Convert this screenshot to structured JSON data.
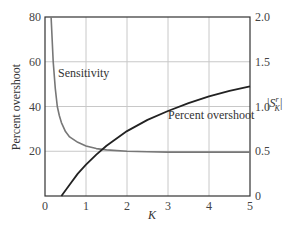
{
  "chart_data": {
    "type": "line",
    "title": "",
    "xlabel": "K",
    "ylabel": "Percent overshoot",
    "y2label": "|S_K^r|",
    "xlim": [
      0,
      5
    ],
    "ylim": [
      0,
      80
    ],
    "y2lim": [
      0,
      2.0
    ],
    "x_ticks": [
      "0",
      "1",
      "2",
      "3",
      "4",
      "5"
    ],
    "y_ticks": [
      "80",
      "60",
      "40",
      "20"
    ],
    "y2_ticks": [
      "2.0",
      "1.5",
      "1.0",
      "0.5",
      "0"
    ],
    "grid": true,
    "series": [
      {
        "name": "Sensitivity",
        "axis": "right",
        "color": "#777777",
        "x": [
          0.15,
          0.2,
          0.25,
          0.3,
          0.35,
          0.4,
          0.5,
          0.6,
          0.8,
          1.0,
          1.25,
          1.5,
          2.0,
          2.5,
          3.0,
          4.0,
          5.0
        ],
        "values": [
          2.0,
          1.5,
          1.2,
          1.0,
          0.9,
          0.82,
          0.72,
          0.66,
          0.6,
          0.56,
          0.53,
          0.515,
          0.5,
          0.495,
          0.49,
          0.49,
          0.49
        ]
      },
      {
        "name": "Percent overshoot",
        "axis": "left",
        "color": "#222222",
        "x": [
          0.4,
          0.6,
          0.8,
          1.0,
          1.25,
          1.5,
          2.0,
          2.5,
          3.0,
          3.5,
          4.0,
          4.5,
          5.0
        ],
        "values": [
          0,
          5,
          10,
          14,
          18.5,
          22.5,
          29,
          34,
          38,
          41.5,
          44.5,
          47,
          49
        ]
      }
    ],
    "annotations": [
      "Sensitivity",
      "Percent overshoot"
    ]
  }
}
